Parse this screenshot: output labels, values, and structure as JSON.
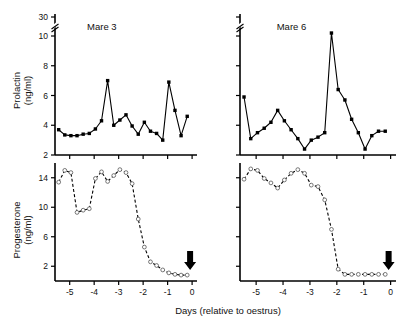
{
  "figure": {
    "xlabel": "Days (relative to oestrus)",
    "panels": [
      {
        "id": "mare3-prolactin",
        "title": "Mare 3",
        "ylabel_line1": "Prolactin",
        "ylabel_line2": "(ng/ml)"
      },
      {
        "id": "mare6-prolactin",
        "title": "Mare 6",
        "ylabel_line1": "",
        "ylabel_line2": ""
      },
      {
        "id": "mare3-progesterone",
        "title": "",
        "ylabel_line1": "Progesterone",
        "ylabel_line2": "(ng/ml)"
      },
      {
        "id": "mare6-progesterone",
        "title": "",
        "ylabel_line1": "",
        "ylabel_line2": ""
      }
    ],
    "marker_annotation": "down-arrow-at-oestrus"
  },
  "chart_data": [
    {
      "type": "line",
      "id": "mare3-prolactin",
      "title": "Mare 3",
      "xlabel": "Days (relative to oestrus)",
      "ylabel": "Prolactin (ng/ml)",
      "xlim": [
        -5.6,
        0.2
      ],
      "ylim": [
        2,
        30
      ],
      "yticks": [
        2,
        4,
        6,
        8,
        10,
        30
      ],
      "ytick_labels": [
        "2",
        "4",
        "6",
        "8",
        "10",
        "30"
      ],
      "axis_break": {
        "between": [
          10,
          30
        ],
        "style": "double-slash"
      },
      "xticks": [
        -5,
        -4,
        -3,
        -2,
        -1,
        0
      ],
      "xtick_labels": [
        "-5",
        "-4",
        "-3",
        "-2",
        "-1",
        "0"
      ],
      "grid": false,
      "legend": "none",
      "marker": "filled-square",
      "linestyle": "solid",
      "x": [
        -5.45,
        -5.2,
        -4.95,
        -4.7,
        -4.45,
        -4.2,
        -3.95,
        -3.7,
        -3.45,
        -3.2,
        -2.95,
        -2.7,
        -2.45,
        -2.2,
        -1.95,
        -1.7,
        -1.45,
        -1.2,
        -0.95,
        -0.7,
        -0.45,
        -0.2
      ],
      "values": [
        3.7,
        3.35,
        3.3,
        3.3,
        3.4,
        3.45,
        3.75,
        4.3,
        7.0,
        4.0,
        4.35,
        4.7,
        3.95,
        3.4,
        4.2,
        3.6,
        3.45,
        3.0,
        6.9,
        5.0,
        3.3,
        4.6
      ]
    },
    {
      "type": "line",
      "id": "mare6-prolactin",
      "title": "Mare 6",
      "xlabel": "Days (relative to oestrus)",
      "ylabel": "Prolactin (ng/ml)",
      "xlim": [
        -5.6,
        0.2
      ],
      "ylim": [
        2,
        30
      ],
      "yticks": [
        2,
        4,
        6,
        8,
        10,
        30
      ],
      "ytick_labels": [
        "2",
        "4",
        "6",
        "8",
        "10",
        "30"
      ],
      "axis_break": {
        "between": [
          10,
          30
        ],
        "style": "double-slash"
      },
      "xticks": [
        -5,
        -4,
        -3,
        -2,
        -1,
        0
      ],
      "xtick_labels": [
        "-5",
        "-4",
        "-3",
        "-2",
        "-1",
        "0"
      ],
      "grid": false,
      "legend": "none",
      "marker": "filled-square",
      "linestyle": "solid",
      "x": [
        -5.45,
        -5.2,
        -4.95,
        -4.7,
        -4.45,
        -4.2,
        -3.95,
        -3.7,
        -3.45,
        -3.2,
        -2.95,
        -2.7,
        -2.45,
        -2.2,
        -1.95,
        -1.7,
        -1.45,
        -1.2,
        -0.95,
        -0.7,
        -0.45,
        -0.2
      ],
      "values": [
        5.9,
        3.1,
        3.5,
        3.8,
        4.2,
        5.0,
        4.3,
        3.7,
        3.1,
        2.4,
        3.0,
        3.2,
        3.5,
        10.2,
        6.4,
        5.7,
        4.4,
        3.5,
        2.4,
        3.3,
        3.6,
        3.6
      ]
    },
    {
      "type": "line",
      "id": "mare3-progesterone",
      "title": "Mare 3",
      "xlabel": "Days (relative to oestrus)",
      "ylabel": "Progesterone (ng/ml)",
      "xlim": [
        -5.6,
        0.2
      ],
      "ylim": [
        0,
        16
      ],
      "yticks": [
        2,
        6,
        10,
        14
      ],
      "ytick_labels": [
        "2",
        "6",
        "10",
        "14"
      ],
      "xticks": [
        -5,
        -4,
        -3,
        -2,
        -1,
        0
      ],
      "xtick_labels": [
        "-5",
        "-4",
        "-3",
        "-2",
        "-1",
        "0"
      ],
      "grid": false,
      "legend": "none",
      "marker": "open-circle",
      "linestyle": "dashed",
      "x": [
        -5.45,
        -5.2,
        -4.95,
        -4.7,
        -4.45,
        -4.2,
        -3.95,
        -3.7,
        -3.45,
        -3.2,
        -2.95,
        -2.7,
        -2.45,
        -2.2,
        -1.95,
        -1.7,
        -1.45,
        -1.2,
        -0.95,
        -0.7,
        -0.45,
        -0.2
      ],
      "values": [
        13.4,
        15.0,
        14.7,
        9.3,
        9.6,
        9.8,
        13.9,
        14.8,
        13.5,
        14.3,
        15.1,
        14.7,
        13.2,
        8.4,
        4.6,
        2.6,
        2.1,
        1.5,
        1.1,
        0.9,
        0.8,
        0.8
      ]
    },
    {
      "type": "line",
      "id": "mare6-progesterone",
      "title": "Mare 6",
      "xlabel": "Days (relative to oestrus)",
      "ylabel": "Progesterone (ng/ml)",
      "xlim": [
        -5.6,
        0.2
      ],
      "ylim": [
        0,
        16
      ],
      "yticks": [
        2,
        6,
        10,
        14
      ],
      "ytick_labels": [
        "2",
        "6",
        "10",
        "14"
      ],
      "xticks": [
        -5,
        -4,
        -3,
        -2,
        -1,
        0
      ],
      "xtick_labels": [
        "-5",
        "-4",
        "-3",
        "-2",
        "-1",
        "0"
      ],
      "grid": false,
      "legend": "none",
      "marker": "open-circle",
      "linestyle": "dashed",
      "x": [
        -5.45,
        -5.2,
        -4.95,
        -4.7,
        -4.45,
        -4.2,
        -3.95,
        -3.7,
        -3.45,
        -3.2,
        -2.95,
        -2.7,
        -2.45,
        -2.2,
        -1.95,
        -1.7,
        -1.45,
        -1.2,
        -0.95,
        -0.7,
        -0.45,
        -0.2
      ],
      "values": [
        13.8,
        15.2,
        15.0,
        13.9,
        13.3,
        12.6,
        13.7,
        14.6,
        15.1,
        14.6,
        13.0,
        12.8,
        11.0,
        7.0,
        1.6,
        0.9,
        0.9,
        0.9,
        0.9,
        0.9,
        0.9,
        0.9
      ]
    }
  ]
}
